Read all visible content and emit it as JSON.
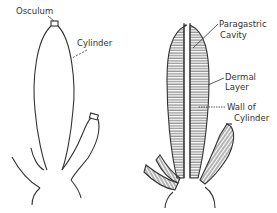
{
  "figure": {
    "left": {
      "description": "External view of simple sponge",
      "labels": {
        "osculum": "Osculum",
        "cylinder": "Cylinder"
      }
    },
    "right": {
      "description": "Longitudinal section of sponge",
      "labels": {
        "paragastric_1": "Paragastric",
        "paragastric_2": "Cavity",
        "dermal_1": "Dermal",
        "dermal_2": "Layer",
        "wall_1": "Wall of",
        "wall_2": "Cylinder"
      }
    },
    "colors": {
      "line": "#333333",
      "background": "#ffffff"
    }
  }
}
